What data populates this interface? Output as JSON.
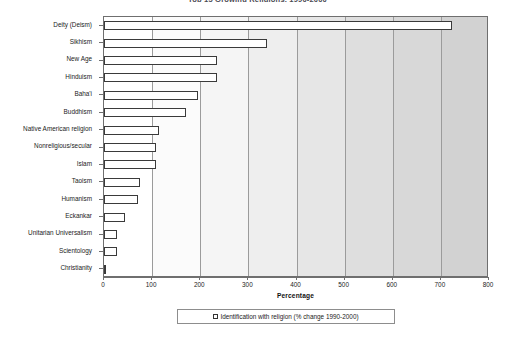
{
  "chart_data": {
    "type": "bar",
    "orientation": "horizontal",
    "title": "Top 15 Growing Religions, 1990-2000",
    "xlabel": "Percentage",
    "ylabel": "",
    "xlim": [
      0,
      800
    ],
    "xticks": [
      0,
      100,
      200,
      300,
      400,
      500,
      600,
      700,
      800
    ],
    "grid": true,
    "grid_axis": "x",
    "legend_position": "bottom",
    "legend": [
      "Identification with religion (% change 1990-2000)"
    ],
    "series": [
      {
        "name": "Identification with religion (% change 1990-2000)",
        "values": [
          723,
          339,
          235,
          235,
          195,
          170,
          115,
          108,
          108,
          74,
          71,
          44,
          27,
          26,
          5
        ]
      }
    ],
    "categories": [
      "Deity (Deism)",
      "Sikhism",
      "New Age",
      "Hinduism",
      "Baha'i",
      "Buddhism",
      "Native American religion",
      "Nonreligious/secular",
      "Islam",
      "Taoism",
      "Humanism",
      "Eckankar",
      "Unitarian Universalism",
      "Scientology",
      "Christianity"
    ],
    "colors": {
      "bar_fill": "#ffffff",
      "bar_outline": "#3a3a3a",
      "axis": "#6f6f6f",
      "gridline": "#9b9b9b",
      "text": "#1b1b1b"
    },
    "band_shades": [
      "#ffffff",
      "#fbfbfb",
      "#f5f5f5",
      "#eeeeee",
      "#e6e6e6",
      "#dedede",
      "#d8d8d8",
      "#d2d2d2"
    ]
  }
}
